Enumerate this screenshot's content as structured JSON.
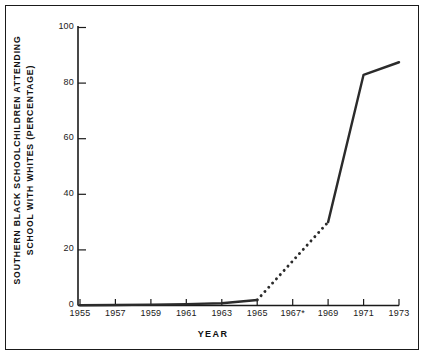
{
  "chart_data": {
    "type": "line",
    "title": "",
    "subtitle": "",
    "xlabel": "YEAR",
    "ylabel": "SOUTHERN BLACK SCHOOLCHILDREN ATTENDING SCHOOL WITH WHITES (PERCENTAGE)",
    "ylabel_lines": [
      "SOUTHERN BLACK SCHOOLCHILDREN ATTENDING",
      "SCHOOL WITH WHITES (PERCENTAGE)"
    ],
    "xlim": [
      1955,
      1973
    ],
    "ylim": [
      0,
      100
    ],
    "grid": false,
    "legend": "none",
    "x_tick_labels": [
      "1955",
      "1957",
      "1959",
      "1961",
      "1963",
      "1965",
      "1967*",
      "1969",
      "1971",
      "1973"
    ],
    "x_tick_values": [
      1955,
      1957,
      1959,
      1961,
      1963,
      1965,
      1967,
      1969,
      1971,
      1973
    ],
    "y_tick_labels": [
      "0",
      "20",
      "40",
      "60",
      "80",
      "100"
    ],
    "y_tick_values": [
      0,
      20,
      40,
      60,
      80,
      100
    ],
    "x": [
      1955,
      1957,
      1959,
      1961,
      1963,
      1965,
      1967,
      1969,
      1971,
      1973
    ],
    "values": [
      0.1,
      0.2,
      0.3,
      0.5,
      0.8,
      2.0,
      15.0,
      30.0,
      83.0,
      87.5
    ],
    "series": [
      {
        "name": "Percentage attending school with whites",
        "style": "solid",
        "points": [
          {
            "x": 1955,
            "y": 0.1
          },
          {
            "x": 1957,
            "y": 0.2
          },
          {
            "x": 1959,
            "y": 0.3
          },
          {
            "x": 1961,
            "y": 0.5
          },
          {
            "x": 1963,
            "y": 0.8
          },
          {
            "x": 1965,
            "y": 2.0
          }
        ]
      },
      {
        "name": "Interpolated (estimated) segment",
        "style": "dotted",
        "points": [
          {
            "x": 1965,
            "y": 2.0
          },
          {
            "x": 1969,
            "y": 30.0
          }
        ]
      },
      {
        "name": "Percentage attending school with whites (late period)",
        "style": "solid",
        "points": [
          {
            "x": 1969,
            "y": 30.0
          },
          {
            "x": 1971,
            "y": 83.0
          },
          {
            "x": 1973,
            "y": 87.5
          }
        ]
      }
    ],
    "annotations": [
      {
        "text": "1967*",
        "note": "asterisk on 1967 x-axis tick label"
      }
    ],
    "colors": {
      "line": "#2b2b2b",
      "axis": "#1a1a1a",
      "background": "#ffffff",
      "border": "#1a1a1a",
      "text": "#111111"
    }
  }
}
